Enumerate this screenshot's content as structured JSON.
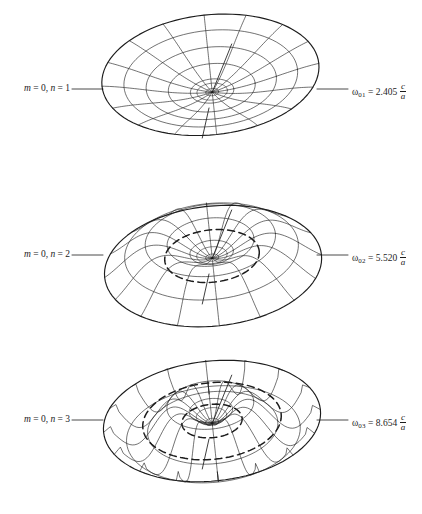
{
  "figure": {
    "line_color": "#1c1c1c",
    "background_color": "#ffffff",
    "width": 422,
    "height": 514
  },
  "panels": [
    {
      "id": "mode-01",
      "mode_label": {
        "m_symbol": "m",
        "m_eq": " = 0, ",
        "n_symbol": "n",
        "n_eq": " = 1",
        "text": "m = 0, n = 1"
      },
      "frequency": {
        "symbol": "ω",
        "subscript": "01",
        "equals": " = ",
        "value": "2.405",
        "numerator": "c",
        "denominator": "a",
        "text": "ω₀₁ = 2.405 c/a"
      },
      "nodal_circles": 0,
      "bessel_root": 2.405
    },
    {
      "id": "mode-02",
      "mode_label": {
        "m_symbol": "m",
        "m_eq": " = 0, ",
        "n_symbol": "n",
        "n_eq": " = 2",
        "text": "m = 0, n = 2"
      },
      "frequency": {
        "symbol": "ω",
        "subscript": "02",
        "equals": " = ",
        "value": "5.520",
        "numerator": "c",
        "denominator": "a",
        "text": "ω₀₂ = 5.520 c/a"
      },
      "nodal_circles": 1,
      "bessel_root": 5.52
    },
    {
      "id": "mode-03",
      "mode_label": {
        "m_symbol": "m",
        "m_eq": " = 0, ",
        "n_symbol": "n",
        "n_eq": " = 3",
        "text": "m = 0, n = 3"
      },
      "frequency": {
        "symbol": "ω",
        "subscript": "03",
        "equals": " = ",
        "value": "8.654",
        "numerator": "c",
        "denominator": "a",
        "text": "ω₀₃ = 8.654 c/a"
      },
      "nodal_circles": 2,
      "bessel_root": 8.654
    }
  ],
  "geometry": {
    "panel_centers_y": [
      90,
      256,
      421
    ],
    "center_x": 212,
    "rim_radius_x": 109,
    "rim_radius_y": 60,
    "tilt_deg": -6,
    "radial_spokes": 16,
    "mesh_rings": 5,
    "amplitudes": [
      30,
      30,
      32
    ],
    "leader_left": {
      "x1": 72,
      "x2": 103
    },
    "leader_right": {
      "x1": 317,
      "x2": 348
    },
    "axis_line_deg": 68,
    "axis_len_top": 52,
    "axis_len_bottom": 48
  }
}
